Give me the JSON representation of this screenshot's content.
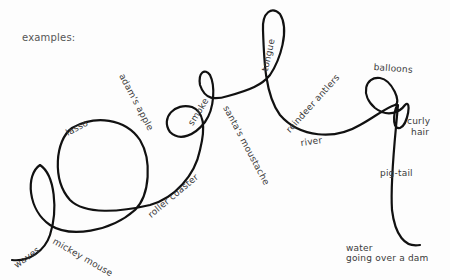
{
  "diagram": {
    "title": "examples:",
    "stroke_color": "#111111",
    "background": "#fdfdfd",
    "labels": [
      {
        "id": "lasso",
        "text": "lasso"
      },
      {
        "id": "adams-apple",
        "text": "adam's apple"
      },
      {
        "id": "smoke",
        "text": "smoke"
      },
      {
        "id": "santas-moustache",
        "text": "santa's moustache"
      },
      {
        "id": "tongue",
        "text": "tongue"
      },
      {
        "id": "reindeer-antlers",
        "text": "reindeer antlers"
      },
      {
        "id": "river",
        "text": "river"
      },
      {
        "id": "balloons",
        "text": "balloons"
      },
      {
        "id": "curly-hair-1",
        "text": "curly"
      },
      {
        "id": "curly-hair-2",
        "text": "hair"
      },
      {
        "id": "pig-tail",
        "text": "pig-tail"
      },
      {
        "id": "roller-coaster",
        "text": "roller coaster"
      },
      {
        "id": "mickey-mouse",
        "text": "mickey mouse"
      },
      {
        "id": "waves",
        "text": "waves"
      },
      {
        "id": "water-1",
        "text": "water"
      },
      {
        "id": "water-2",
        "text": "going over a dam"
      }
    ]
  }
}
